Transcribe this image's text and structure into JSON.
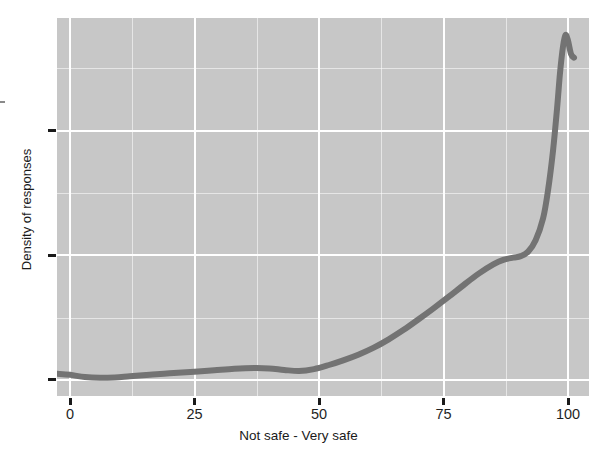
{
  "chart": {
    "title": "",
    "xlabel": "Not safe - Very safe",
    "ylabel": "Density of responses",
    "panel_background": "#c7c7c7",
    "gridline_color": "#ffffff",
    "curve_color": "#737373",
    "x_ticklabels": [
      "0",
      "25",
      "50",
      "75",
      "100"
    ]
  },
  "chart_data": {
    "type": "line",
    "title": "",
    "xlabel": "Not safe - Very safe",
    "ylabel": "Density of responses",
    "xlim": [
      -2.6,
      104.2
    ],
    "ylim": [
      0,
      1
    ],
    "grid": true,
    "legend": null,
    "x_ticks": [
      0,
      25,
      50,
      75,
      100
    ],
    "x_ticklabels": [
      "0",
      "25",
      "50",
      "75",
      "100"
    ],
    "y_ticks": [
      0.043,
      0.372,
      0.702
    ],
    "y_ticklabels": [
      "",
      "",
      ""
    ],
    "series": [
      {
        "name": "Density of responses",
        "color": "#737373",
        "x": [
          -2.6,
          0,
          3,
          6,
          9,
          12,
          16,
          20,
          25,
          29,
          33,
          37,
          40,
          43,
          46,
          49,
          52,
          55,
          58,
          61,
          64,
          67,
          70,
          73,
          76,
          79,
          82,
          85,
          87,
          89,
          90.5,
          92,
          93.5,
          95,
          96,
          97,
          97.8,
          98.4,
          99,
          99.5,
          100,
          100.6,
          101.2
        ],
        "y": [
          0.059,
          0.056,
          0.05,
          0.048,
          0.049,
          0.052,
          0.056,
          0.06,
          0.064,
          0.068,
          0.072,
          0.074,
          0.073,
          0.069,
          0.066,
          0.071,
          0.082,
          0.095,
          0.11,
          0.128,
          0.15,
          0.175,
          0.203,
          0.232,
          0.262,
          0.293,
          0.323,
          0.348,
          0.36,
          0.366,
          0.37,
          0.382,
          0.412,
          0.47,
          0.545,
          0.65,
          0.76,
          0.855,
          0.925,
          0.955,
          0.94,
          0.905,
          0.895
        ]
      }
    ]
  },
  "axis_geometry": {
    "panel_left_px": 57,
    "panel_top_px": 18,
    "panel_width_px": 532,
    "panel_height_px": 378,
    "x0_px": 13,
    "x_unit_px": 4.98,
    "y_baseline_px": 378,
    "y_unit_px": 378
  }
}
